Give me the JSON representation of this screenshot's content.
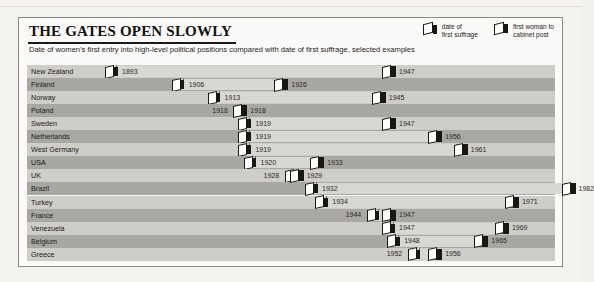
{
  "header": {
    "title": "THE GATES OPEN SLOWLY",
    "subtitle": "Date of women's first entry into high-level political positions compared with date of first suffrage, selected examples"
  },
  "legend": {
    "items": [
      {
        "icon": "open-gate-icon",
        "label": "date of\nfirst suffrage"
      },
      {
        "icon": "closed-gate-icon",
        "label": "first woman to\ncabinet post"
      }
    ]
  },
  "colors": {
    "row_light": "#cfcdc8",
    "row_dark": "#a9a7a2",
    "bar": "#d9d7d2",
    "marker": "#18180f",
    "card_bg": "#fbfaf8",
    "page_bg": "#f4f3f0"
  },
  "chart_data": {
    "type": "bar",
    "title": "THE GATES OPEN SLOWLY",
    "subtitle": "Date of women's first entry into high-level political positions compared with date of first suffrage, selected examples",
    "xlabel": "",
    "ylabel": "",
    "xlim": [
      1890,
      1985
    ],
    "grid": false,
    "legend_position": "top-right",
    "categories": [
      "New Zealand",
      "Finland",
      "Norway",
      "Poland",
      "Sweden",
      "Netherlands",
      "West Germany",
      "USA",
      "UK",
      "Brazil",
      "Turkey",
      "France",
      "Venezuela",
      "Belgium",
      "Greece"
    ],
    "series": [
      {
        "name": "date of first suffrage",
        "values": [
          1893,
          1906,
          1913,
          1918,
          1919,
          1919,
          1919,
          1920,
          1928,
          1932,
          1934,
          1944,
          1947,
          1948,
          1952
        ]
      },
      {
        "name": "first woman to cabinet post",
        "values": [
          1947,
          1926,
          1945,
          1918,
          1947,
          1956,
          1961,
          1933,
          1929,
          1982,
          1971,
          1947,
          1969,
          1965,
          1956
        ]
      }
    ],
    "rows": [
      {
        "country": "New Zealand",
        "suffrage": 1893,
        "cabinet": 1947
      },
      {
        "country": "Finland",
        "suffrage": 1906,
        "cabinet": 1926
      },
      {
        "country": "Norway",
        "suffrage": 1913,
        "cabinet": 1945
      },
      {
        "country": "Poland",
        "suffrage": 1918,
        "cabinet": 1918
      },
      {
        "country": "Sweden",
        "suffrage": 1919,
        "cabinet": 1947
      },
      {
        "country": "Netherlands",
        "suffrage": 1919,
        "cabinet": 1956
      },
      {
        "country": "West Germany",
        "suffrage": 1919,
        "cabinet": 1961
      },
      {
        "country": "USA",
        "suffrage": 1920,
        "cabinet": 1933
      },
      {
        "country": "UK",
        "suffrage": 1928,
        "cabinet": 1929
      },
      {
        "country": "Brazil",
        "suffrage": 1932,
        "cabinet": 1982
      },
      {
        "country": "Turkey",
        "suffrage": 1934,
        "cabinet": 1971
      },
      {
        "country": "France",
        "suffrage": 1944,
        "cabinet": 1947
      },
      {
        "country": "Venezuela",
        "suffrage": 1947,
        "cabinet": 1969
      },
      {
        "country": "Belgium",
        "suffrage": 1948,
        "cabinet": 1965
      },
      {
        "country": "Greece",
        "suffrage": 1952,
        "cabinet": 1956
      }
    ]
  }
}
